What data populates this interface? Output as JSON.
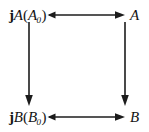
{
  "diagram": {
    "type": "commutative-square",
    "background_color": "#ffffff",
    "ink_color": "#1c1c1c",
    "nodes": [
      {
        "id": "top-left",
        "position": "top-left",
        "text": "jA(A0)",
        "parts": {
          "operator": "j",
          "functor": "A",
          "open": "(",
          "argument": "A",
          "subscript": "0",
          "close": ")"
        }
      },
      {
        "id": "top-right",
        "position": "top-right",
        "text": "A",
        "parts": {
          "functor": "A"
        }
      },
      {
        "id": "bottom-left",
        "position": "bottom-left",
        "text": "jB(B0)",
        "parts": {
          "operator": "j",
          "functor": "B",
          "open": "(",
          "argument": "B",
          "subscript": "0",
          "close": ")"
        }
      },
      {
        "id": "bottom-right",
        "position": "bottom-right",
        "text": "B",
        "parts": {
          "functor": "B"
        }
      }
    ],
    "arrows": [
      {
        "id": "top-arrow",
        "from": "top-left",
        "to": "top-right",
        "direction": "right",
        "style": "tailed-arrow",
        "label": ""
      },
      {
        "id": "bottom-arrow",
        "from": "bottom-left",
        "to": "bottom-right",
        "direction": "right",
        "style": "tailed-arrow",
        "label": ""
      },
      {
        "id": "left-arrow",
        "from": "top-left",
        "to": "bottom-left",
        "direction": "down",
        "style": "plain-arrow",
        "label": ""
      },
      {
        "id": "right-arrow",
        "from": "top-right",
        "to": "bottom-right",
        "direction": "down",
        "style": "plain-arrow",
        "label": ""
      }
    ]
  }
}
